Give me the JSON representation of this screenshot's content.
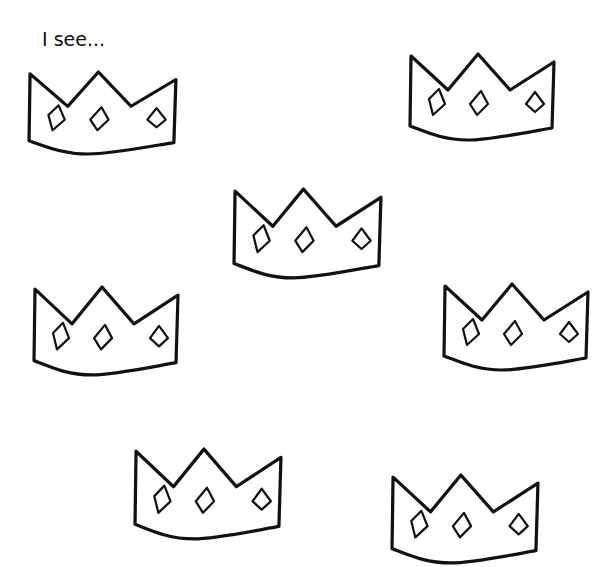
{
  "worksheet": {
    "prompt_text": "I see...",
    "ink_color": "#111111",
    "background_color": "#ffffff",
    "crowns": [
      {
        "id": "crown-1",
        "x": 27,
        "y": 70,
        "w": 153,
        "h": 86
      },
      {
        "id": "crown-2",
        "x": 408,
        "y": 52,
        "w": 150,
        "h": 90
      },
      {
        "id": "crown-3",
        "x": 232,
        "y": 187,
        "w": 153,
        "h": 93
      },
      {
        "id": "crown-4",
        "x": 32,
        "y": 285,
        "w": 150,
        "h": 92
      },
      {
        "id": "crown-5",
        "x": 442,
        "y": 282,
        "w": 150,
        "h": 90
      },
      {
        "id": "crown-6",
        "x": 133,
        "y": 447,
        "w": 152,
        "h": 94
      },
      {
        "id": "crown-7",
        "x": 390,
        "y": 473,
        "w": 152,
        "h": 92
      }
    ],
    "crown_icon": "crown-with-three-diamonds-icon"
  }
}
